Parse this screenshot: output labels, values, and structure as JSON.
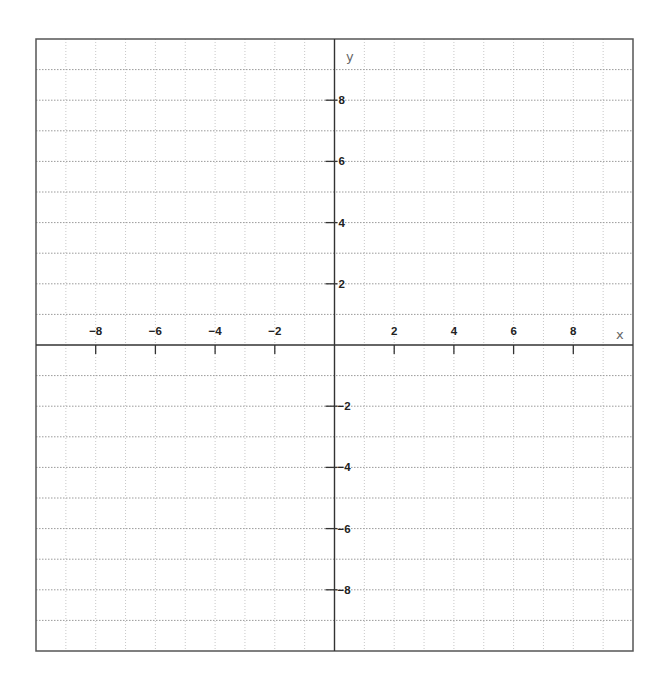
{
  "graph": {
    "x_axis_label": "x",
    "y_axis_label": "y",
    "x_range": [
      -10,
      10
    ],
    "y_range": [
      -10,
      10
    ],
    "grid_step": 1,
    "label_step": 2,
    "x_tick_labels": [
      {
        "value": -8,
        "text": "−8"
      },
      {
        "value": -6,
        "text": "−6"
      },
      {
        "value": -4,
        "text": "−4"
      },
      {
        "value": -2,
        "text": "−2"
      },
      {
        "value": 2,
        "text": "2"
      },
      {
        "value": 4,
        "text": "4"
      },
      {
        "value": 6,
        "text": "6"
      },
      {
        "value": 8,
        "text": "8"
      }
    ],
    "y_tick_labels": [
      {
        "value": 8,
        "text": "8"
      },
      {
        "value": 6,
        "text": "6"
      },
      {
        "value": 4,
        "text": "4"
      },
      {
        "value": 2,
        "text": "2"
      },
      {
        "value": -2,
        "text": "−2"
      },
      {
        "value": -4,
        "text": "−4"
      },
      {
        "value": -6,
        "text": "−6"
      },
      {
        "value": -8,
        "text": "−8"
      }
    ],
    "colors": {
      "border": "#555555",
      "axis": "#333333",
      "grid_horizontal": "#9a9a9a",
      "grid_vertical": "#c8c8c8",
      "label": "#222222",
      "axis_name": "#666666"
    }
  }
}
